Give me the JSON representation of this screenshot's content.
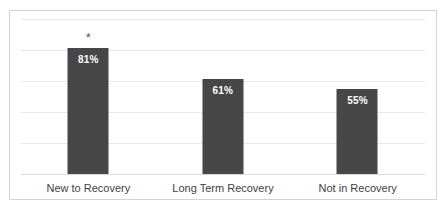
{
  "chart_data": {
    "type": "bar",
    "title": "",
    "subtitle": "",
    "xlabel": "",
    "ylabel": "",
    "ylim": [
      0,
      100
    ],
    "grid": true,
    "gridline_count": 5,
    "legend": "none",
    "orientation": "vertical",
    "categories": [
      "New to Recovery",
      "Long Term Recovery",
      "Not in Recovery"
    ],
    "values": [
      81,
      61,
      55
    ],
    "value_labels": [
      "81%",
      "61%",
      "55%"
    ],
    "annotations": [
      {
        "category": "New to Recovery",
        "text": "*"
      }
    ],
    "colors": {
      "bar": "#474747",
      "value_label": "#ffffff",
      "gridline": "#e8e8e8",
      "frame_border": "#d3d3d3",
      "background": "#ffffff",
      "category_label": "#3f3f3f",
      "annotation": "#595959"
    }
  },
  "axis": {
    "tick_labels": []
  }
}
